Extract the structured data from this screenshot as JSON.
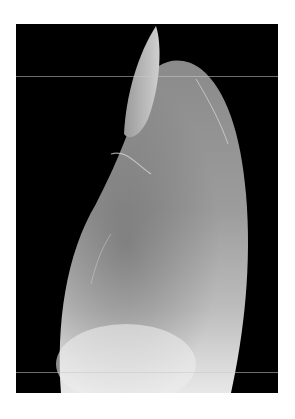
{
  "image": {
    "subject": "grayscale close-up photograph of a fingertip and nail in profile on black background",
    "colors": {
      "background": "#000000",
      "border": "#ffffff",
      "skin_light": "#e6e6e6",
      "skin_mid": "#9a9a9a",
      "skin_dark": "#4a4a4a"
    }
  }
}
